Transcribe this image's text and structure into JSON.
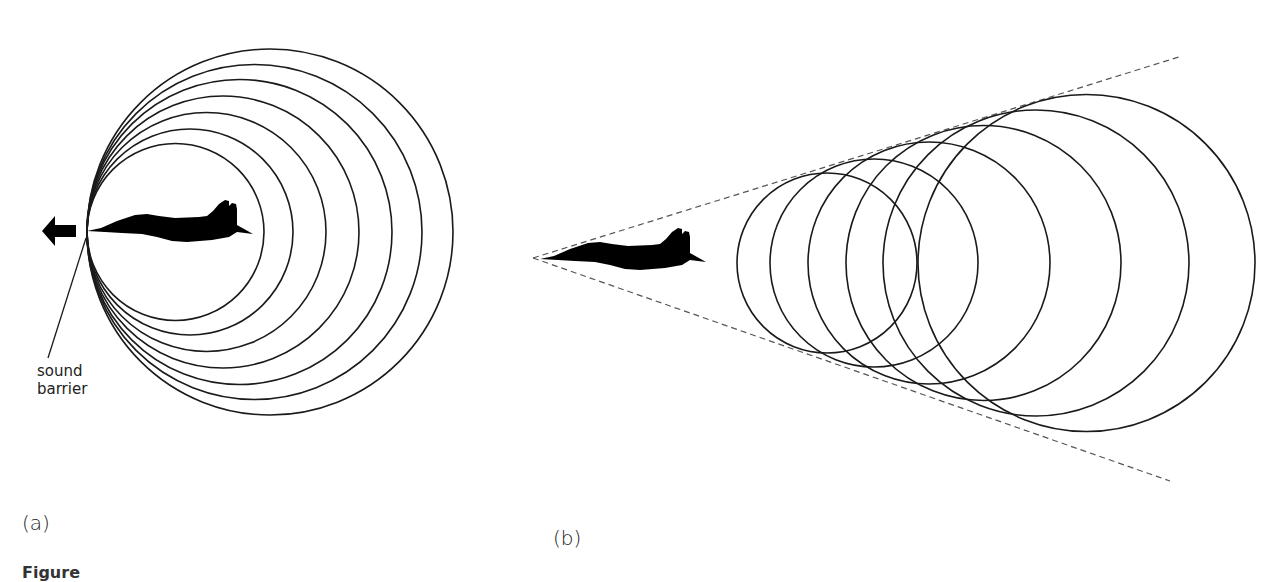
{
  "figure": {
    "panel_a": {
      "label": "(a)",
      "annotation_line1": "sound",
      "annotation_line2": "barrier",
      "motion_arrow": "arrow-left",
      "circle_count": 7
    },
    "panel_b": {
      "label": "(b)",
      "circle_count": 6,
      "cone": "dashed Mach cone"
    },
    "caption": "Figure"
  },
  "colors": {
    "stroke": "#1a1a1a",
    "fill": "#000000",
    "dashed": "#555555",
    "background": "#ffffff"
  }
}
